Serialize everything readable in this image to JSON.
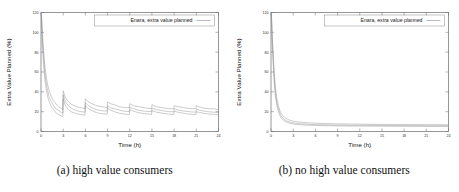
{
  "figure": {
    "panel_count": 2
  },
  "panels": [
    {
      "id": "panel-a",
      "caption": "(a) high value consumers",
      "legend": {
        "label": "Enara, extra value planned"
      },
      "chart_data": {
        "type": "line",
        "title": "",
        "xlabel": "Time (h)",
        "ylabel": "Extra Value Planned (%)",
        "xlim": [
          0,
          24
        ],
        "ylim": [
          0,
          120
        ],
        "xticks": [
          0,
          3,
          6,
          9,
          12,
          15,
          18,
          21,
          24
        ],
        "yticks": [
          0,
          20,
          40,
          60,
          80,
          100,
          120
        ],
        "grid": false,
        "legend_position": "top-right",
        "series": [
          {
            "name": "upper band",
            "x": [
              0.05,
              0.2,
              0.35,
              0.5,
              0.7,
              0.9,
              1.1,
              1.4,
              1.7,
              2.0,
              2.4,
              2.8,
              2.95,
              3.0,
              3.3,
              3.7,
              4.2,
              4.8,
              5.4,
              5.95,
              6.0,
              6.4,
              6.9,
              7.5,
              8.2,
              8.95,
              9.0,
              9.4,
              9.9,
              10.6,
              11.3,
              11.95,
              12.0,
              12.5,
              13.2,
              14.0,
              14.9,
              14.95,
              15.0,
              15.6,
              16.4,
              17.3,
              17.95,
              18.0,
              18.6,
              19.4,
              20.3,
              20.95,
              21.0,
              21.7,
              22.5,
              23.3,
              24.0
            ],
            "y": [
              120,
              98,
              82,
              68,
              56,
              47,
              41,
              35,
              31,
              28,
              25,
              23,
              22,
              41,
              34,
              30,
              27,
              25,
              24,
              23,
              33,
              30,
              28,
              26,
              25,
              24,
              30,
              28,
              27,
              25,
              24,
              24,
              28,
              26,
              25,
              24,
              23,
              23,
              27,
              25,
              24,
              23,
              23,
              26,
              25,
              24,
              23,
              23,
              26,
              24,
              23,
              23,
              22
            ]
          },
          {
            "name": "middle band",
            "x": [
              0.05,
              0.2,
              0.35,
              0.5,
              0.7,
              0.9,
              1.1,
              1.4,
              1.7,
              2.0,
              2.4,
              2.8,
              2.95,
              3.0,
              3.3,
              3.7,
              4.2,
              4.8,
              5.4,
              5.95,
              6.0,
              6.4,
              6.9,
              7.5,
              8.2,
              8.95,
              9.0,
              9.4,
              9.9,
              10.6,
              11.3,
              11.95,
              12.0,
              12.5,
              13.2,
              14.0,
              14.9,
              14.95,
              15.0,
              15.6,
              16.4,
              17.3,
              17.95,
              18.0,
              18.6,
              19.4,
              20.3,
              20.95,
              21.0,
              21.7,
              22.5,
              23.3,
              24.0
            ],
            "y": [
              118,
              92,
              75,
              61,
              49,
              41,
              35,
              30,
              26,
              23,
              21,
              19,
              18.5,
              37,
              30,
              26,
              23,
              21,
              20,
              19.5,
              29,
              26,
              24,
              22,
              21,
              20.5,
              26,
              24,
              23,
              21.5,
              20.5,
              20,
              24.5,
              23,
              21.5,
              20.5,
              20,
              19.8,
              23.5,
              22,
              21,
              20,
              19.8,
              23,
              21.5,
              20.5,
              19.8,
              19.5,
              22.5,
              21,
              20,
              19.5,
              19
            ]
          },
          {
            "name": "lower band",
            "x": [
              0.05,
              0.2,
              0.35,
              0.5,
              0.7,
              0.9,
              1.1,
              1.4,
              1.7,
              2.0,
              2.4,
              2.8,
              2.95,
              3.0,
              3.3,
              3.7,
              4.2,
              4.8,
              5.4,
              5.95,
              6.0,
              6.4,
              6.9,
              7.5,
              8.2,
              8.95,
              9.0,
              9.4,
              9.9,
              10.6,
              11.3,
              11.95,
              12.0,
              12.5,
              13.2,
              14.0,
              14.9,
              14.95,
              15.0,
              15.6,
              16.4,
              17.3,
              17.95,
              18.0,
              18.6,
              19.4,
              20.3,
              20.95,
              21.0,
              21.7,
              22.5,
              23.3,
              24.0
            ],
            "y": [
              116,
              86,
              68,
              54,
              43,
              35,
              30,
              25,
              22,
              19,
              17,
              15.5,
              15,
              33,
              26,
              22,
              19.5,
              18,
              17,
              16.5,
              26,
              23,
              21,
              19,
              18,
              17.5,
              23.5,
              21.5,
              20,
              18.5,
              17.5,
              17,
              22,
              20.5,
              19,
              18,
              17.3,
              17,
              21,
              19.5,
              18.5,
              17.5,
              17.2,
              20.5,
              19.3,
              18.2,
              17.3,
              17,
              20,
              18.8,
              17.8,
              17.2,
              16.8
            ]
          }
        ]
      }
    },
    {
      "id": "panel-b",
      "caption": "(b) no high value consumers",
      "legend": {
        "label": "Enara, extra value planned"
      },
      "chart_data": {
        "type": "line",
        "title": "",
        "xlabel": "Time (h)",
        "ylabel": "Extra Value Planned (%)",
        "xlim": [
          0,
          24
        ],
        "ylim": [
          0,
          120
        ],
        "xticks": [
          0,
          3,
          6,
          9,
          12,
          15,
          18,
          21,
          24
        ],
        "yticks": [
          0,
          20,
          40,
          60,
          80,
          100,
          120
        ],
        "grid": false,
        "legend_position": "top-right",
        "series": [
          {
            "name": "upper band",
            "x": [
              0.05,
              0.15,
              0.3,
              0.45,
              0.6,
              0.8,
              1.0,
              1.2,
              1.4,
              1.6,
              1.8,
              2.0,
              2.2,
              2.5,
              2.8,
              3.2,
              3.6,
              4.0,
              4.6,
              5.2,
              6.0,
              7.0,
              8.0,
              9.0,
              10.0,
              11.0,
              12.0,
              13.0,
              14.0,
              15.0,
              16.0,
              17.0,
              18.0,
              19.0,
              20.0,
              21.0,
              22.0,
              23.0,
              24.0
            ],
            "y": [
              120,
              100,
              78,
              58,
              44,
              33,
              26,
              21,
              18,
              16,
              14.5,
              13.5,
              12.5,
              11.5,
              10.8,
              10.2,
              9.8,
              9.4,
              9.0,
              8.7,
              8.4,
              8.1,
              7.9,
              7.7,
              7.6,
              7.5,
              7.4,
              7.3,
              7.2,
              7.2,
              7.1,
              7.1,
              7.0,
              7.0,
              7.0,
              6.9,
              6.9,
              6.9,
              6.8
            ]
          },
          {
            "name": "middle band",
            "x": [
              0.05,
              0.15,
              0.3,
              0.45,
              0.6,
              0.8,
              1.0,
              1.2,
              1.4,
              1.6,
              1.8,
              2.0,
              2.2,
              2.5,
              2.8,
              3.2,
              3.6,
              4.0,
              4.6,
              5.2,
              6.0,
              7.0,
              8.0,
              9.0,
              10.0,
              11.0,
              12.0,
              13.0,
              14.0,
              15.0,
              16.0,
              17.0,
              18.0,
              19.0,
              20.0,
              21.0,
              22.0,
              23.0,
              24.0
            ],
            "y": [
              119,
              96,
              73,
              53,
              39,
              29,
              23,
              18.5,
              15.5,
              13.5,
              12.2,
              11.2,
              10.4,
              9.6,
              9.0,
              8.5,
              8.1,
              7.8,
              7.5,
              7.2,
              7.0,
              6.8,
              6.6,
              6.5,
              6.4,
              6.3,
              6.3,
              6.2,
              6.2,
              6.1,
              6.1,
              6.0,
              6.0,
              6.0,
              5.9,
              5.9,
              5.9,
              5.8,
              5.8
            ]
          },
          {
            "name": "lower band",
            "x": [
              0.05,
              0.15,
              0.3,
              0.45,
              0.6,
              0.8,
              1.0,
              1.2,
              1.4,
              1.6,
              1.8,
              2.0,
              2.2,
              2.5,
              2.8,
              3.2,
              3.6,
              4.0,
              4.6,
              5.2,
              6.0,
              7.0,
              8.0,
              9.0,
              10.0,
              11.0,
              12.0,
              13.0,
              14.0,
              15.0,
              16.0,
              17.0,
              18.0,
              19.0,
              20.0,
              21.0,
              22.0,
              23.0,
              24.0
            ],
            "y": [
              118,
              92,
              68,
              48,
              35,
              26,
              20,
              16,
              13.5,
              11.8,
              10.6,
              9.8,
              9.1,
              8.4,
              7.9,
              7.4,
              7.1,
              6.8,
              6.5,
              6.3,
              6.1,
              5.9,
              5.8,
              5.7,
              5.6,
              5.5,
              5.5,
              5.4,
              5.4,
              5.3,
              5.3,
              5.3,
              5.2,
              5.2,
              5.2,
              5.1,
              5.1,
              5.1,
              5.0
            ]
          }
        ]
      }
    }
  ]
}
